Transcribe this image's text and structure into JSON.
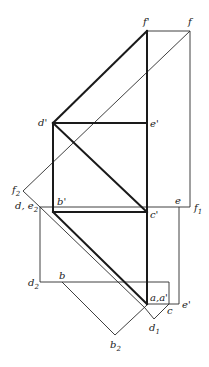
{
  "diagram": {
    "type": "descriptive-geometry-projection",
    "points": {
      "f_prime": {
        "label": "f'",
        "x": 147,
        "y": 31
      },
      "f": {
        "label": "f",
        "x": 190,
        "y": 31
      },
      "d_prime": {
        "label": "d'",
        "x": 53,
        "y": 123
      },
      "e_prime_top": {
        "label": "e'",
        "x": 147,
        "y": 123
      },
      "f2": {
        "label": "f",
        "sub": "2",
        "x": 23,
        "y": 191
      },
      "d_e2": {
        "label": "d, e",
        "sub": "2",
        "x": 40,
        "y": 207
      },
      "b_prime": {
        "label": "b'",
        "x": 53,
        "y": 212
      },
      "c_prime": {
        "label": "c'",
        "x": 147,
        "y": 212
      },
      "e": {
        "label": "e",
        "x": 179,
        "y": 207
      },
      "f1": {
        "label": "f",
        "sub": "1",
        "x": 190,
        "y": 207
      },
      "d2": {
        "label": "d",
        "sub": "2",
        "x": 41,
        "y": 282
      },
      "b": {
        "label": "b",
        "x": 62,
        "y": 282
      },
      "a_aprime": {
        "label": "a, a'",
        "x": 147,
        "y": 304
      },
      "c": {
        "label": "c",
        "x": 169,
        "y": 304
      },
      "e_prime_bottom": {
        "label": "e'",
        "x": 179,
        "y": 304
      },
      "d1": {
        "label": "d",
        "sub": "1",
        "x": 154,
        "y": 319
      },
      "b2": {
        "label": "b",
        "sub": "2",
        "x": 115,
        "y": 335
      }
    },
    "labels": {
      "f_prime": "f'",
      "f": "f",
      "d_prime": "d'",
      "e_prime_top": "e'",
      "f2_main": "f",
      "f2_sub": "2",
      "de2_main": "d,  e",
      "de2_sub": "2",
      "b_prime": "b'",
      "c_prime": "c'",
      "e": "e",
      "f1_main": "f",
      "f1_sub": "1",
      "d2_main": "d",
      "d2_sub": "2",
      "b": "b",
      "a_aprime": "a,a'",
      "c": "c",
      "e_prime_bottom": "e'",
      "d1_main": "d",
      "d1_sub": "1",
      "b2_main": "b",
      "b2_sub": "2"
    }
  }
}
